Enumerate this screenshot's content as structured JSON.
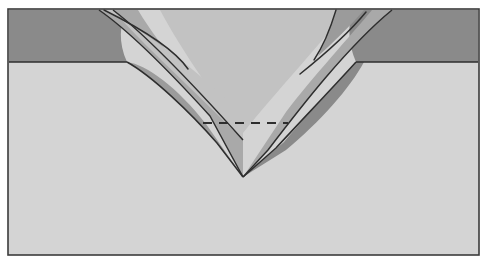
{
  "figure": {
    "title": "Geological cross-section of a doubly-vergent orogenic wedge",
    "caption": "",
    "width": 489,
    "height": 264
  },
  "frame": {
    "x": 8,
    "y": 9,
    "width": 471,
    "height": 246,
    "border_color": "#3b3b3b",
    "border_width": 1.6,
    "background_color": "#d4d4d4"
  },
  "palette": {
    "background_white": "#ffffff",
    "basement_light": "#d4d4d4",
    "wedge_mid": "#a9a9a9",
    "cover_dark": "#8a8a8a",
    "sheet_light": "#c2c2c2",
    "outline": "#2e2e2e",
    "dashed_line": "#2e2e2e"
  },
  "layers": [
    {
      "id": "basement",
      "name": "undeformed-basement",
      "label": "Light grey substratum / foreland basement",
      "color": "#d4d4d4",
      "tone": "light"
    },
    {
      "id": "cover-left",
      "name": "cover-unit-left",
      "label": "Dark cover layer (left / pro-side)",
      "color": "#8a8a8a",
      "tone": "dark",
      "top_y": 10,
      "base_y": 62,
      "left_x": 9
    },
    {
      "id": "cover-right",
      "name": "cover-unit-right",
      "label": "Dark cover layer (right / retro-side)",
      "color": "#8a8a8a",
      "tone": "dark",
      "top_y": 10,
      "base_y": 62,
      "right_x": 478
    },
    {
      "id": "wedge-core",
      "name": "central-wedge-core",
      "label": "Central V-shaped wedge / subduction channel",
      "color": "#c2c2c2",
      "tone": "light-mid",
      "apex_x": 243,
      "apex_y": 177
    },
    {
      "id": "thrust-sheet-left-outer",
      "name": "thrust-sheet-left-outer",
      "label": "Outer thrust sheet, left vergence",
      "color": "#a9a9a9",
      "tone": "mid"
    },
    {
      "id": "thrust-sheet-left-inner",
      "name": "thrust-sheet-left-inner",
      "label": "Inner thrust sheet, left vergence",
      "color": "#c2c2c2",
      "tone": "light-mid"
    },
    {
      "id": "thrust-sheet-right-outer",
      "name": "thrust-sheet-right-outer",
      "label": "Outer thrust sheet, right vergence",
      "color": "#a9a9a9",
      "tone": "mid"
    },
    {
      "id": "thrust-sheet-right-inner",
      "name": "thrust-sheet-right-inner",
      "label": "Inner thrust sheet, right vergence",
      "color": "#8a8a8a",
      "tone": "dark"
    }
  ],
  "annotations": {
    "detachment": {
      "name": "detachment-dashed-line",
      "label": "Décollement / detachment horizon",
      "x1": 203,
      "x2": 288,
      "y": 123,
      "dash_pattern": "9 7",
      "stroke_width": 2.2,
      "color": "#2e2e2e"
    }
  },
  "geometry": {
    "wedge_apex": {
      "x": 243,
      "y": 177
    },
    "left_shelf_break": {
      "x": 127,
      "y": 62
    },
    "right_shelf_break": {
      "x": 356,
      "y": 62
    },
    "crest_left": {
      "x": 103,
      "y": 10
    },
    "crest_right": {
      "x": 368,
      "y": 10
    }
  }
}
